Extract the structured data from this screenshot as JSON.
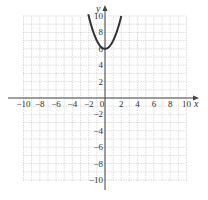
{
  "chart_data": {
    "type": "line",
    "title": "",
    "xlabel": "x",
    "ylabel": "y",
    "xlim": [
      -10,
      10
    ],
    "ylim": [
      -10,
      10
    ],
    "grid": true,
    "xticks": [
      -10,
      -8,
      -6,
      -4,
      -2,
      0,
      2,
      4,
      6,
      8,
      10
    ],
    "yticks": [
      -10,
      -8,
      -6,
      -4,
      -2,
      2,
      4,
      6,
      8,
      10
    ],
    "xtick_labels": [
      "−10",
      "−8",
      "−6",
      "−4",
      "−2",
      "0",
      "2",
      "4",
      "6",
      "8",
      "10"
    ],
    "ytick_labels": [
      "−10",
      "−8",
      "−6",
      "−4",
      "−2",
      "2",
      "4",
      "6",
      "8",
      "10"
    ],
    "series": [
      {
        "name": "y = x^2 + 6",
        "function": "x^2 + 6",
        "x": [
          -2,
          -1.5,
          -1,
          -0.5,
          0,
          0.5,
          1,
          1.5,
          2
        ],
        "y": [
          10,
          8.25,
          7,
          6.25,
          6,
          6.25,
          7,
          8.25,
          10
        ],
        "color": "#333333"
      }
    ],
    "legend": "none"
  },
  "axes": {
    "x_label": "x",
    "y_label": "y"
  }
}
